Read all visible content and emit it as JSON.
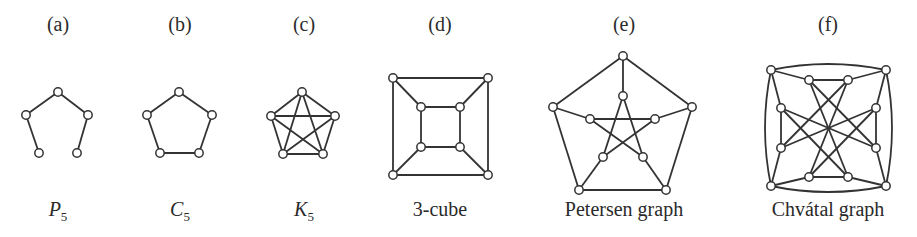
{
  "figure": {
    "panels": [
      {
        "id": "a",
        "label": "(a)",
        "label_x": 58,
        "caption_main": "P",
        "caption_sub": "5",
        "caption_italic": true,
        "caption_x": 58,
        "nodes": [
          [
            58,
            92
          ],
          [
            26,
            115
          ],
          [
            88,
            115
          ],
          [
            39,
            153
          ],
          [
            77,
            153
          ]
        ],
        "edges": [
          [
            0,
            1
          ],
          [
            0,
            2
          ],
          [
            1,
            3
          ],
          [
            2,
            4
          ]
        ]
      },
      {
        "id": "b",
        "label": "(b)",
        "label_x": 180,
        "caption_main": "C",
        "caption_sub": "5",
        "caption_italic": true,
        "caption_x": 180,
        "nodes": [
          [
            179,
            92
          ],
          [
            147,
            115
          ],
          [
            212,
            115
          ],
          [
            160,
            153
          ],
          [
            199,
            153
          ]
        ],
        "edges": [
          [
            0,
            1
          ],
          [
            0,
            2
          ],
          [
            1,
            3
          ],
          [
            2,
            4
          ],
          [
            3,
            4
          ]
        ]
      },
      {
        "id": "c",
        "label": "(c)",
        "label_x": 304,
        "caption_main": "K",
        "caption_sub": "5",
        "caption_italic": true,
        "caption_x": 304,
        "nodes": [
          [
            302,
            92
          ],
          [
            271,
            116
          ],
          [
            335,
            116
          ],
          [
            283,
            154
          ],
          [
            323,
            154
          ]
        ],
        "edges": [
          [
            0,
            1
          ],
          [
            0,
            2
          ],
          [
            0,
            3
          ],
          [
            0,
            4
          ],
          [
            1,
            2
          ],
          [
            1,
            3
          ],
          [
            1,
            4
          ],
          [
            2,
            3
          ],
          [
            2,
            4
          ],
          [
            3,
            4
          ]
        ]
      },
      {
        "id": "d",
        "label": "(d)",
        "label_x": 440,
        "caption_main": "3-cube",
        "caption_sub": "",
        "caption_italic": false,
        "caption_x": 440,
        "nodes": [
          [
            393,
            78
          ],
          [
            488,
            78
          ],
          [
            393,
            175
          ],
          [
            488,
            175
          ],
          [
            421,
            107
          ],
          [
            460,
            107
          ],
          [
            421,
            147
          ],
          [
            460,
            147
          ]
        ],
        "edges": [
          [
            0,
            1
          ],
          [
            0,
            2
          ],
          [
            1,
            3
          ],
          [
            2,
            3
          ],
          [
            4,
            5
          ],
          [
            4,
            6
          ],
          [
            5,
            7
          ],
          [
            6,
            7
          ],
          [
            0,
            4
          ],
          [
            1,
            5
          ],
          [
            2,
            6
          ],
          [
            3,
            7
          ]
        ]
      },
      {
        "id": "e",
        "label": "(e)",
        "label_x": 624,
        "caption_main": "Petersen graph",
        "caption_sub": "",
        "caption_italic": false,
        "caption_x": 624,
        "nodes": [
          [
            623,
            56
          ],
          [
            553,
            107
          ],
          [
            692,
            107
          ],
          [
            579,
            190
          ],
          [
            666,
            190
          ],
          [
            623,
            96
          ],
          [
            590,
            119
          ],
          [
            655,
            119
          ],
          [
            603,
            157
          ],
          [
            643,
            157
          ]
        ],
        "edges": [
          [
            0,
            1
          ],
          [
            0,
            2
          ],
          [
            1,
            3
          ],
          [
            2,
            4
          ],
          [
            3,
            4
          ],
          [
            0,
            5
          ],
          [
            1,
            6
          ],
          [
            2,
            7
          ],
          [
            3,
            8
          ],
          [
            4,
            9
          ],
          [
            5,
            8
          ],
          [
            5,
            9
          ],
          [
            6,
            7
          ],
          [
            6,
            9
          ],
          [
            7,
            8
          ]
        ]
      },
      {
        "id": "f",
        "label": "(f)",
        "label_x": 828,
        "caption_main": "Chvátal graph",
        "caption_sub": "",
        "caption_italic": false,
        "caption_x": 828,
        "nodes": [
          [
            771,
            70
          ],
          [
            886,
            70
          ],
          [
            771,
            186
          ],
          [
            886,
            186
          ],
          [
            809,
            80
          ],
          [
            848,
            80
          ],
          [
            809,
            177
          ],
          [
            848,
            177
          ],
          [
            781,
            108
          ],
          [
            781,
            148
          ],
          [
            876,
            108
          ],
          [
            876,
            148
          ]
        ],
        "edges": [
          [
            0,
            4
          ],
          [
            0,
            8
          ],
          [
            1,
            5
          ],
          [
            1,
            10
          ],
          [
            2,
            9
          ],
          [
            2,
            6
          ],
          [
            3,
            11
          ],
          [
            3,
            7
          ],
          [
            4,
            5
          ],
          [
            6,
            7
          ],
          [
            8,
            9
          ],
          [
            10,
            11
          ],
          [
            4,
            7
          ],
          [
            4,
            11
          ],
          [
            5,
            6
          ],
          [
            5,
            9
          ],
          [
            8,
            11
          ],
          [
            8,
            7
          ],
          [
            10,
            9
          ],
          [
            10,
            6
          ]
        ],
        "arcs": [
          "M771,70 Q828,58 886,70",
          "M771,186 Q828,198 886,186",
          "M771,70 Q759,128 771,186",
          "M886,70 Q898,128 886,186"
        ]
      }
    ]
  },
  "chart_data": {
    "type": "graph-diagram",
    "title": "",
    "graphs": [
      {
        "panel": "(a)",
        "name": "P5",
        "vertices": 5,
        "edges": 4
      },
      {
        "panel": "(b)",
        "name": "C5",
        "vertices": 5,
        "edges": 5
      },
      {
        "panel": "(c)",
        "name": "K5",
        "vertices": 5,
        "edges": 10
      },
      {
        "panel": "(d)",
        "name": "3-cube",
        "vertices": 8,
        "edges": 12
      },
      {
        "panel": "(e)",
        "name": "Petersen graph",
        "vertices": 10,
        "edges": 15
      },
      {
        "panel": "(f)",
        "name": "Chvátal graph",
        "vertices": 12,
        "edges": 24
      }
    ]
  }
}
